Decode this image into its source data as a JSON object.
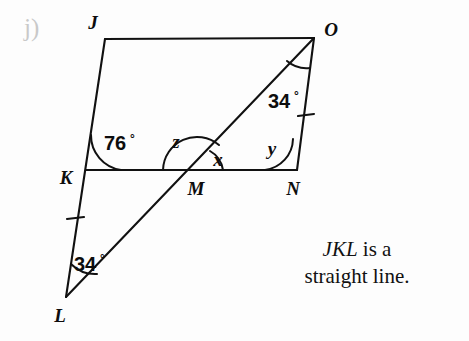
{
  "item": {
    "letter": "j)"
  },
  "figure": {
    "type": "geometry-diagram",
    "shape": "parallelogram JONK with diagonal line L-M-O",
    "vertices": [
      {
        "name": "J",
        "x": 105,
        "y": 39,
        "label_x": 93,
        "label_y": 29
      },
      {
        "name": "O",
        "x": 314,
        "y": 38,
        "label_x": 327,
        "label_y": 31
      },
      {
        "name": "K",
        "x": 86,
        "y": 170,
        "label_x": 64,
        "label_y": 180
      },
      {
        "name": "N",
        "x": 297,
        "y": 170,
        "label_x": 290,
        "label_y": 192
      },
      {
        "name": "M",
        "x": 197,
        "y": 170,
        "label_x": 190,
        "label_y": 192
      },
      {
        "name": "L",
        "x": 66,
        "y": 297,
        "label_x": 58,
        "label_y": 318
      }
    ],
    "segments": [
      {
        "name": "JO",
        "from": "J",
        "to": "O"
      },
      {
        "name": "JL",
        "from": "J",
        "to": "L"
      },
      {
        "name": "KN",
        "from": "K",
        "to": "N"
      },
      {
        "name": "ON",
        "from": "O",
        "to": "N"
      },
      {
        "name": "LO",
        "from": "L",
        "to": "O"
      }
    ],
    "tick_marks": [
      {
        "name": "tick-KL",
        "on": "segment KL",
        "x": 75,
        "y": 219
      },
      {
        "name": "tick-ON",
        "on": "segment ON",
        "x": 306,
        "y": 115
      }
    ],
    "angles": [
      {
        "name": "angle-K",
        "label": "76",
        "unit": "°",
        "vertex": "K",
        "label_x": 104,
        "label_y": 143
      },
      {
        "name": "angle-O",
        "label": "34",
        "unit": "°",
        "vertex": "O",
        "label_x": 268,
        "label_y": 102
      },
      {
        "name": "angle-L",
        "label": "34",
        "unit": "°",
        "vertex": "L",
        "label_x": 74,
        "label_y": 265
      },
      {
        "name": "angle-z",
        "label": "z",
        "unit": "",
        "vertex": "M",
        "label_x": 174,
        "label_y": 144
      },
      {
        "name": "angle-x",
        "label": "x",
        "unit": "",
        "vertex": "M",
        "label_x": 215,
        "label_y": 161
      },
      {
        "name": "angle-y",
        "label": "y",
        "unit": "",
        "vertex": "N",
        "label_x": 269,
        "label_y": 150
      }
    ],
    "colors": {
      "stroke": "#111111",
      "background": "#fdfdfd",
      "item_letter": "#c9c9c9"
    }
  },
  "note": {
    "line1_italic": "JKL",
    "line1_rest": " is a",
    "line2": "straight line."
  }
}
